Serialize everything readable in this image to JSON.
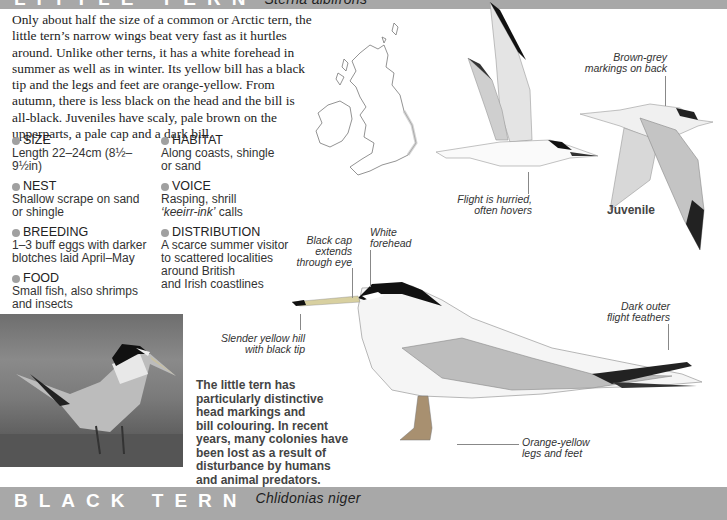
{
  "header_top": {
    "common_name": "LITTLE TERN",
    "latin_name": "Sterna albifrons"
  },
  "intro_text": "Only about half the size of a common or Arctic tern, the little tern’s narrow wings beat very fast as it hurtles around. Unlike other terns, it has a white forehead in summer as well as in winter. Its yellow bill has a black tip and the legs and feet are orange-yellow. From autumn, there is less black on the head and the bill is all-black. Juveniles have scaly, pale brown on the upperparts, a pale cap and a dark bill.",
  "facts_left": [
    {
      "label": "SIZE",
      "text": "Length 22–24cm (8½–9½in)"
    },
    {
      "label": "NEST",
      "text": "Shallow scrape on sand\nor shingle"
    },
    {
      "label": "BREEDING",
      "text": "1–3 buff eggs with darker\nblotches laid April–May"
    },
    {
      "label": "FOOD",
      "text": "Small fish, also shrimps\nand insects"
    }
  ],
  "facts_right": [
    {
      "label": "HABITAT",
      "text": "Along coasts, shingle\nor sand"
    },
    {
      "label": "VOICE",
      "text_pre": "Rasping, shrill\n",
      "text_italic": "‘keeirr-ink’",
      "text_post": " calls"
    },
    {
      "label": "DISTRIBUTION",
      "text": "A scarce summer visitor\nto scattered localities\naround British\nand Irish coastlines"
    }
  ],
  "captions": {
    "brown_grey": "Brown-grey\nmarkings on back",
    "flight": "Flight is hurried,\noften hovers",
    "juvenile": "Juvenile",
    "black_cap": "Black cap\nextends\nthrough eye",
    "white_forehead": "White\nforehead",
    "bill": "Slender yellow hill\nwith black tip",
    "dark_outer": "Dark outer\nflight feathers",
    "legs": "Orange-yellow\nlegs and feet"
  },
  "photo_caption": "The little tern has\nparticularly distinctive\nhead markings and\nbill colouring. In recent\nyears, many colonies have\nbeen lost as a result of\ndisturbance by humans\nand animal predators.",
  "header_bottom": {
    "common_name": "BLACK TERN",
    "latin_name": "Chlidonias niger"
  },
  "colors": {
    "bar": "#a8a8a8",
    "bullet": "#a0a0a0",
    "cap": "#111111"
  }
}
